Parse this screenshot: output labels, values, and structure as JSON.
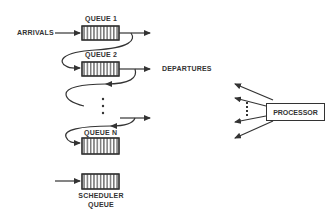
{
  "diagram": {
    "labels": {
      "arrivals": "ARRIVALS",
      "queue_1": "QUEUE 1",
      "queue_2": "QUEUE 2",
      "queue_n": "QUEUE N",
      "departures": "DEPARTURES",
      "processor": "PROCESSOR",
      "scheduler_line1": "SCHEDULER",
      "scheduler_line2": "QUEUE"
    },
    "colors": {
      "stroke": "#333333",
      "background": "#ffffff"
    }
  }
}
